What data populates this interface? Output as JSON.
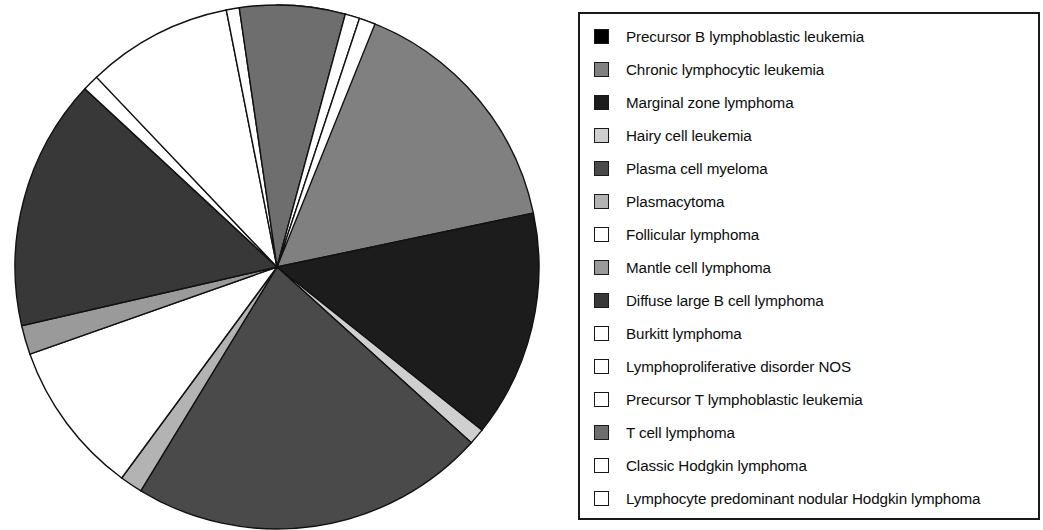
{
  "figure": {
    "type": "pie-chart-with-legend",
    "background_color": "#ffffff"
  },
  "legend": {
    "border_color": "#1a1a1a",
    "items": [
      {
        "label": "Precursor B lymphoblastic leukemia",
        "color": "#000000",
        "pattern": "solid-black"
      },
      {
        "label": "Chronic lymphocytic leukemia",
        "color": "#808080",
        "pattern": "medium-gray"
      },
      {
        "label": "Marginal zone lymphoma",
        "color": "#1c1c1c",
        "pattern": "near-black"
      },
      {
        "label": "Hairy cell leukemia",
        "color": "#cfcfcf",
        "pattern": "light-gray"
      },
      {
        "label": "Plasma cell myeloma",
        "color": "#4a4a4a",
        "pattern": "dark-gray"
      },
      {
        "label": "Plasmacytoma",
        "color": "#b3b3b3",
        "pattern": "pale-gray"
      },
      {
        "label": "Follicular lymphoma",
        "color": "#ffffff",
        "pattern": "white"
      },
      {
        "label": "Mantle cell lymphoma",
        "color": "#9a9a9a",
        "pattern": "mid-gray"
      },
      {
        "label": "Diffuse large B cell lymphoma",
        "color": "#383838",
        "pattern": "dark-gray"
      },
      {
        "label": "Burkitt lymphoma",
        "color": "#ffffff",
        "pattern": "white"
      },
      {
        "label": "Lymphoproliferative disorder NOS",
        "color": "#ffffff",
        "pattern": "white"
      },
      {
        "label": "Precursor T lymphoblastic leukemia",
        "color": "#ffffff",
        "pattern": "white"
      },
      {
        "label": "T cell lymphoma",
        "color": "#6e6e6e",
        "pattern": "gray"
      },
      {
        "label": "Classic Hodgkin lymphoma",
        "color": "#ffffff",
        "pattern": "white"
      },
      {
        "label": "Lymphocyte predominant nodular Hodgkin lymphoma",
        "color": "#ffffff",
        "pattern": "white"
      }
    ]
  },
  "chart_data": {
    "type": "pie",
    "title": "",
    "start_angle_deg": 0,
    "direction": "clockwise",
    "center": {
      "x": 277,
      "y": 267
    },
    "radius": 262,
    "legend_position": "right",
    "grid": false,
    "categories": [
      "Precursor B lymphoblastic leukemia",
      "Chronic lymphocytic leukemia",
      "Marginal zone lymphoma",
      "Hairy cell leukemia",
      "Plasma cell myeloma",
      "Plasmacytoma",
      "Follicular lymphoma",
      "Mantle cell lymphoma",
      "Diffuse large B cell lymphoma",
      "Burkitt lymphoma",
      "Lymphoproliferative disorder NOS",
      "Precursor T lymphoblastic leukemia",
      "T cell lymphoma",
      "Classic Hodgkin lymphoma",
      "Lymphocyte predominant nodular Hodgkin lymphoma"
    ],
    "values": [
      4.2,
      17.5,
      14.0,
      1.0,
      22.0,
      1.4,
      9.5,
      1.8,
      15.5,
      1.0,
      9.0,
      0.8,
      6.5,
      0.9,
      1.0
    ],
    "unit": "percent",
    "slices": [
      {
        "label": "Precursor B lymphoblastic leukemia",
        "percent": 4.2,
        "start_deg": 0.0,
        "end_deg": 15.1,
        "color": "#000000"
      },
      {
        "label": "Chronic lymphocytic leukemia",
        "percent": 17.5,
        "start_deg": 15.1,
        "end_deg": 78.1,
        "color": "#808080"
      },
      {
        "label": "Marginal zone lymphoma",
        "percent": 14.0,
        "start_deg": 78.1,
        "end_deg": 128.5,
        "color": "#1c1c1c"
      },
      {
        "label": "Hairy cell leukemia",
        "percent": 1.0,
        "start_deg": 128.5,
        "end_deg": 132.1,
        "color": "#cfcfcf"
      },
      {
        "label": "Plasma cell myeloma",
        "percent": 22.0,
        "start_deg": 132.1,
        "end_deg": 211.3,
        "color": "#4a4a4a"
      },
      {
        "label": "Plasmacytoma",
        "percent": 1.4,
        "start_deg": 211.3,
        "end_deg": 216.3,
        "color": "#b3b3b3"
      },
      {
        "label": "Follicular lymphoma",
        "percent": 9.5,
        "start_deg": 216.3,
        "end_deg": 250.5,
        "color": "#ffffff"
      },
      {
        "label": "Mantle cell lymphoma",
        "percent": 1.8,
        "start_deg": 250.5,
        "end_deg": 257.0,
        "color": "#9a9a9a"
      },
      {
        "label": "Diffuse large B cell lymphoma",
        "percent": 15.5,
        "start_deg": 257.0,
        "end_deg": 312.8,
        "color": "#383838"
      },
      {
        "label": "Burkitt lymphoma",
        "percent": 1.0,
        "start_deg": 312.8,
        "end_deg": 316.4,
        "color": "#ffffff"
      },
      {
        "label": "Lymphoproliferative disorder NOS",
        "percent": 9.0,
        "start_deg": 316.4,
        "end_deg": 348.8,
        "color": "#ffffff"
      },
      {
        "label": "Precursor T lymphoblastic leukemia",
        "percent": 0.8,
        "start_deg": 348.8,
        "end_deg": 351.7,
        "color": "#ffffff"
      },
      {
        "label": "T cell lymphoma",
        "percent": 6.5,
        "start_deg": 351.7,
        "end_deg": 375.1,
        "color": "#6e6e6e"
      },
      {
        "label": "Classic Hodgkin lymphoma",
        "percent": 0.9,
        "start_deg": 375.1,
        "end_deg": 378.3,
        "color": "#ffffff"
      },
      {
        "label": "Lymphocyte predominant nodular Hodgkin lymphoma",
        "percent": 1.0,
        "start_deg": 378.3,
        "end_deg": 360.0,
        "color": "#ffffff"
      }
    ]
  }
}
